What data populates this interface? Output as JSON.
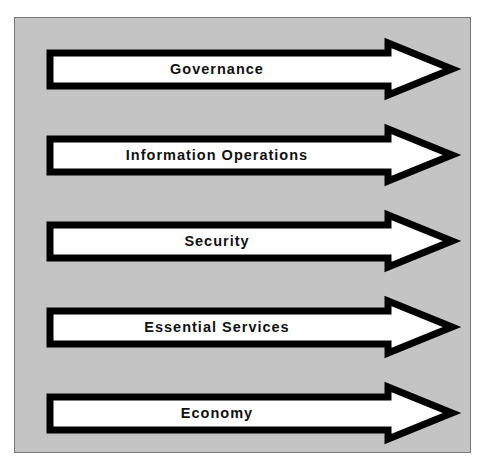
{
  "diagram": {
    "background_color": "#c4c4c4",
    "arrow_fill": "#ffffff",
    "arrow_stroke": "#000000",
    "arrows": [
      {
        "label": "Governance"
      },
      {
        "label": "Information Operations"
      },
      {
        "label": "Security"
      },
      {
        "label": "Essential Services"
      },
      {
        "label": "Economy"
      }
    ]
  }
}
